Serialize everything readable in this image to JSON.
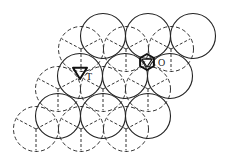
{
  "diagram": {
    "type": "close-packed-layers",
    "radius": 22.5,
    "solid_layer": [
      {
        "x": 103,
        "y": 36
      },
      {
        "x": 148,
        "y": 36
      },
      {
        "x": 193,
        "y": 36
      },
      {
        "x": 80,
        "y": 76
      },
      {
        "x": 125,
        "y": 76
      },
      {
        "x": 170,
        "y": 76
      },
      {
        "x": 58,
        "y": 116
      },
      {
        "x": 103,
        "y": 116
      },
      {
        "x": 148,
        "y": 116
      }
    ],
    "dashed_layer": [
      {
        "x": 81,
        "y": 49
      },
      {
        "x": 126,
        "y": 49
      },
      {
        "x": 171,
        "y": 49
      },
      {
        "x": 58,
        "y": 89
      },
      {
        "x": 103,
        "y": 89
      },
      {
        "x": 148,
        "y": 89
      },
      {
        "x": 36,
        "y": 129
      },
      {
        "x": 81,
        "y": 129
      },
      {
        "x": 126,
        "y": 129
      }
    ],
    "labels": {
      "tetrahedral": "T",
      "octahedral": "O"
    },
    "markers": {
      "tetrahedral": {
        "x": 80,
        "y": 72
      },
      "octahedral": {
        "x": 147,
        "y": 62
      }
    },
    "colors": {
      "stroke": "#222222",
      "background": "#ffffff"
    }
  }
}
